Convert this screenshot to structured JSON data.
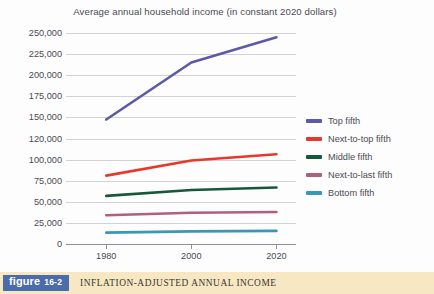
{
  "chart_data": {
    "type": "line",
    "title": "Average annual household income (in constant 2020 dollars)",
    "xlabel": "",
    "ylabel": "",
    "x": [
      1980,
      2000,
      2020
    ],
    "xtick_labels": [
      "1980",
      "2000",
      "2020"
    ],
    "ytick_labels": [
      "250,000",
      "225,000",
      "200,000",
      "175,000",
      "150,000",
      "120,000",
      "100,000",
      "75,000",
      "50,000",
      "25,000",
      "0"
    ],
    "ytick_values": [
      250000,
      225000,
      200000,
      175000,
      150000,
      120000,
      100000,
      75000,
      50000,
      25000,
      0
    ],
    "ylim": [
      0,
      250000
    ],
    "grid": true,
    "legend_position": "right",
    "series": [
      {
        "name": "Top fifth",
        "color": "#5a5aa8",
        "values": [
          147000,
          215000,
          245000
        ]
      },
      {
        "name": "Next-to-top fifth",
        "color": "#e8382b",
        "values": [
          81000,
          99000,
          105000
        ]
      },
      {
        "name": "Middle fifth",
        "color": "#18583a",
        "values": [
          57000,
          64000,
          67000
        ]
      },
      {
        "name": "Next-to-last fifth",
        "color": "#b0607f",
        "values": [
          34000,
          37000,
          38000
        ]
      },
      {
        "name": "Bottom fifth",
        "color": "#3a97b8",
        "values": [
          13500,
          15000,
          15500
        ]
      }
    ]
  },
  "caption": {
    "badge_word": "figure",
    "badge_number": "16-2",
    "text": "INFLATION-ADJUSTED ANNUAL INCOME"
  }
}
